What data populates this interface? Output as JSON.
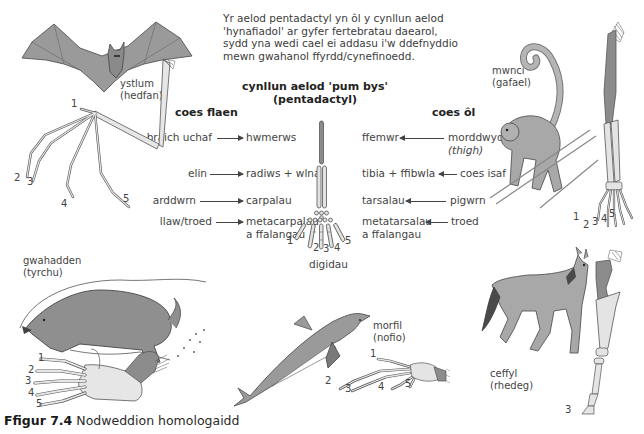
{
  "intro": {
    "lines": [
      "Yr aelod pentadactyl yn ôl y cynllun aelod",
      "'hynafiadol' ar gyfer fertebratau daearol,",
      "sydd yna wedi cael ei addasu i'w ddefnyddio",
      "mewn gwahanol ffyrdd/cynefinoedd."
    ]
  },
  "center_diagram": {
    "title_line1": "cynllun aelod 'pum bys'",
    "title_line2": "(pentadactyl)",
    "digits_label": "digidau",
    "digit_numbers": [
      "1",
      "2",
      "3",
      "4",
      "5"
    ]
  },
  "forelimb": {
    "heading": "coes flaen",
    "rows": [
      {
        "part": "braich uchaf",
        "bone": "hwmerws"
      },
      {
        "part": "elin",
        "bone": "radiws + wlna"
      },
      {
        "part": "arddwrn",
        "bone": "carpalau"
      },
      {
        "part": "llaw/troed",
        "bone": "metacarpalau",
        "bone_line2": "a ffalangau"
      }
    ]
  },
  "hindlimb": {
    "heading": "coes ôl",
    "rows": [
      {
        "part": "morddwyd",
        "part_line2": "(thigh)",
        "bone": "ffemwr"
      },
      {
        "part": "coes isaf",
        "bone": "tibia + ffibwla"
      },
      {
        "part": "pigwrn",
        "bone": "tarsalau"
      },
      {
        "part": "troed",
        "bone": "metatarsalau",
        "bone_line2": "a ffalangau"
      }
    ]
  },
  "animals": {
    "bat": {
      "name": "ystlum",
      "use": "(hedfan)",
      "digits": [
        "1",
        "2",
        "3",
        "4",
        "5"
      ]
    },
    "monkey": {
      "name": "mwnci",
      "use": "(gafael)",
      "digits": [
        "1",
        "2",
        "3",
        "4",
        "5"
      ]
    },
    "mole": {
      "name": "gwahadden",
      "use": "(tyrchu)",
      "digits": [
        "1",
        "2",
        "3",
        "4",
        "5"
      ]
    },
    "whale": {
      "name": "morfil",
      "use": "(nofio)",
      "digits": [
        "1",
        "2",
        "3",
        "4",
        "5"
      ]
    },
    "horse": {
      "name": "ceffyl",
      "use": "(rhedeg)",
      "digits": [
        "3"
      ]
    }
  },
  "caption": {
    "figure_label": "Ffigur 7.4",
    "text": "Nodweddion homologaidd"
  },
  "colors": {
    "animal_fill": "#9a9a9a",
    "animal_stroke": "#5a5a5a",
    "bone_dark": "#8c8c8c",
    "bone_light": "#e2e2e2",
    "text": "#444444"
  }
}
